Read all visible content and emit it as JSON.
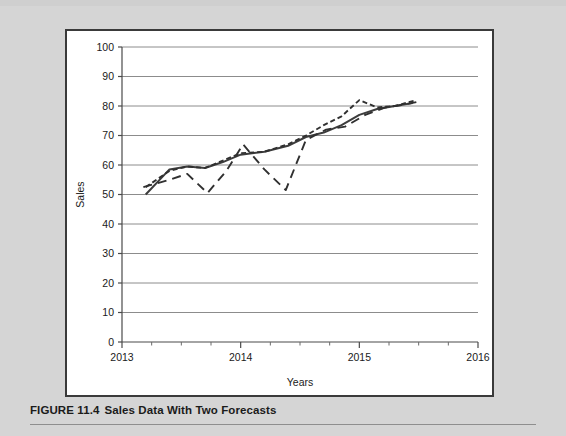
{
  "figure": {
    "number_label": "FIGURE 11.4",
    "title": "Sales Data With Two Forecasts"
  },
  "chart_data": {
    "type": "line",
    "title": "",
    "xlabel": "Years",
    "ylabel": "Sales",
    "xlim": [
      2013,
      2016
    ],
    "ylim": [
      0,
      100
    ],
    "ytick_labels": [
      "0",
      "10",
      "20",
      "30",
      "40",
      "50",
      "60",
      "70",
      "80",
      "90",
      "100"
    ],
    "ytick_values": [
      0,
      10,
      20,
      30,
      40,
      50,
      60,
      70,
      80,
      90,
      100
    ],
    "xtick_labels": [
      "2013",
      "2014",
      "2015",
      "2016"
    ],
    "xtick_values": [
      2013,
      2014,
      2015,
      2016
    ],
    "x_minor_ticks_per_interval": 3,
    "grid": "horizontal",
    "legend_position": "bottom",
    "series": [
      {
        "name": "Sales",
        "style": "solid",
        "color": "#3d3d3d",
        "x": [
          2013.2,
          2013.4,
          2013.55,
          2013.7,
          2013.85,
          2014.0,
          2014.2,
          2014.4,
          2014.55,
          2014.7,
          2014.85,
          2015.0,
          2015.15,
          2015.3,
          2015.45
        ],
        "values": [
          50.0,
          58.5,
          59.5,
          59.0,
          61.0,
          63.5,
          64.5,
          66.5,
          69.5,
          71.0,
          73.5,
          77.0,
          79.0,
          80.0,
          81.0
        ]
      },
      {
        "name": "Sales Rep",
        "style": "short-dash",
        "color": "#303030",
        "x": [
          2013.2,
          2013.4,
          2013.55,
          2013.7,
          2013.85,
          2014.0,
          2014.2,
          2014.4,
          2014.55,
          2014.7,
          2014.85,
          2015.0,
          2015.15,
          2015.3,
          2015.48
        ],
        "values": [
          52.5,
          58.0,
          59.5,
          59.0,
          61.5,
          64.0,
          64.5,
          67.0,
          70.0,
          73.5,
          76.5,
          82.0,
          79.5,
          80.0,
          82.0
        ]
      },
      {
        "name": "Analyst",
        "style": "long-dash",
        "color": "#303030",
        "x": [
          2013.18,
          2013.4,
          2013.55,
          2013.72,
          2013.88,
          2014.02,
          2014.2,
          2014.38,
          2014.55,
          2014.72,
          2014.88,
          2015.05,
          2015.22,
          2015.38,
          2015.5
        ],
        "values": [
          52.5,
          55.0,
          57.0,
          50.5,
          58.0,
          67.0,
          58.5,
          51.5,
          68.5,
          72.0,
          73.0,
          77.0,
          79.5,
          80.5,
          81.5
        ]
      }
    ]
  },
  "legend": {
    "items": [
      {
        "label": "Sales",
        "style": "solid"
      },
      {
        "label": "Sales Rep",
        "style": "short-dash"
      },
      {
        "label": "Analyst",
        "style": "long-dash"
      }
    ]
  }
}
